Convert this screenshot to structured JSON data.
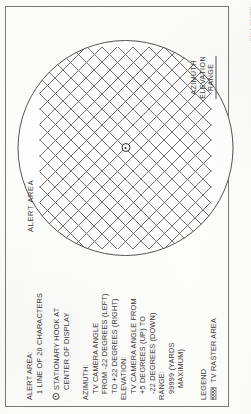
{
  "page": {
    "figure_code": "PAC-1-11CX0115"
  },
  "annotations": {
    "alert_area": {
      "heading": "ALERT AREA:",
      "line1": "1 LINE OF 20 CHARACTERS"
    },
    "hook": {
      "icon": "stationary-hook-icon",
      "line1": "STATIONARY HOOK AT",
      "line2": "CENTER OF DISPLAY"
    },
    "azimuth": {
      "heading": "AZIMUTH:",
      "line1": "TV CAMERA ANGLE",
      "line2": "FROM -22 DEGREES (LEFT)",
      "line3": "TO +22 DEGREES (RIGHT)"
    },
    "elevation": {
      "heading": "ELEVATION:",
      "line1": "TV CAMERA ANGLE FROM",
      "line2": "+5 DEGREES (UP) TO",
      "line3": "-22 DEGREES (DOWN)"
    },
    "range": {
      "heading": "RANGE:",
      "line1": "99999 (YARDS",
      "line2": "MAXIMUM)"
    },
    "legend": {
      "heading": "LEGEND",
      "swatch_label": "TV RASTER AREA"
    }
  },
  "scope": {
    "alert_area_label": "ALERT AREA",
    "readout": {
      "azimuth": "AZIMUTH",
      "elevation": "ELEVATION",
      "range": "RANGE"
    }
  }
}
